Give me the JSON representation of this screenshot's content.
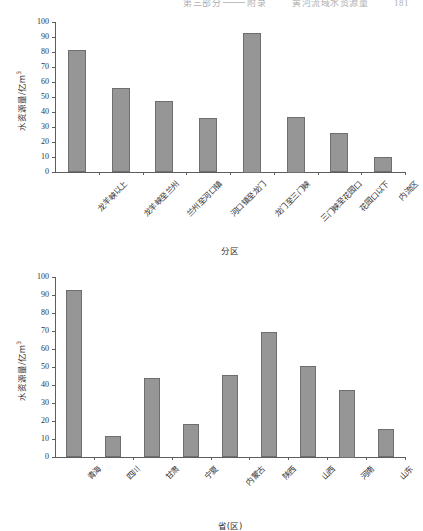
{
  "page": {
    "running_head": {
      "chapter_prefix": "第三部分",
      "separator": "——",
      "chapter_word": "附录",
      "title": "黄河流域水资源量",
      "page_number": "181"
    }
  },
  "figures": [
    {
      "id": "figure-regions",
      "chart_data": {
        "type": "bar",
        "title": "",
        "xlabel": "分区",
        "ylabel": "水资源量/亿m³",
        "ylim": [
          0,
          100
        ],
        "yticks": [
          0,
          10,
          20,
          30,
          40,
          50,
          60,
          70,
          80,
          90,
          100
        ],
        "grid": false,
        "legend": "none",
        "categories": [
          "龙羊峡以上",
          "龙羊峡至兰州",
          "兰州至河口镇",
          "河口镇至龙门",
          "龙门至三门峡",
          "三门峡至花园口",
          "花园口以下",
          "内流区"
        ],
        "values": [
          81.5,
          56.0,
          47.5,
          36.0,
          93.0,
          37.0,
          26.0,
          10.3
        ],
        "series": [
          {
            "name": "水资源量",
            "values": [
              81.5,
              56.0,
              47.5,
              36.0,
              93.0,
              37.0,
              26.0,
              10.3
            ]
          }
        ],
        "bar_color": "#969696",
        "bar_border_color": "#6e6e6e"
      }
    },
    {
      "id": "figure-provinces",
      "chart_data": {
        "type": "bar",
        "title": "",
        "xlabel": "省(区)",
        "ylabel": "水资源量/亿m³",
        "ylim": [
          0,
          100
        ],
        "yticks": [
          0,
          10,
          20,
          30,
          40,
          50,
          60,
          70,
          80,
          90,
          100
        ],
        "grid": false,
        "legend": "none",
        "categories": [
          "青海",
          "四川",
          "甘肃",
          "宁夏",
          "内蒙古",
          "陕西",
          "山西",
          "河南",
          "山东"
        ],
        "values": [
          93.0,
          11.5,
          44.0,
          18.5,
          45.5,
          69.5,
          50.5,
          37.5,
          15.5
        ],
        "series": [
          {
            "name": "水资源量",
            "values": [
              93.0,
              11.5,
              44.0,
              18.5,
              45.5,
              69.5,
              50.5,
              37.5,
              15.5
            ]
          }
        ],
        "bar_color": "#969696",
        "bar_border_color": "#6e6e6e"
      }
    }
  ]
}
